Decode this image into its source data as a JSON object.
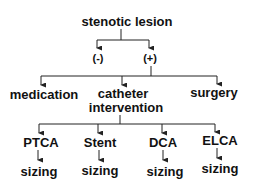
{
  "diagram": {
    "root": {
      "label": "stenotic lesion"
    },
    "level1": [
      {
        "label": "(-)"
      },
      {
        "label": "(+)"
      }
    ],
    "level2": [
      {
        "label": "medication"
      },
      {
        "label_line1": "catheter",
        "label_line2": "intervention"
      },
      {
        "label": "surgery"
      }
    ],
    "level3": [
      {
        "label": "PTCA",
        "child": "sizing"
      },
      {
        "label": "Stent",
        "child": "sizing"
      },
      {
        "label": "DCA",
        "child": "sizing"
      },
      {
        "label": "ELCA",
        "child": "sizing"
      }
    ],
    "colors": {
      "line": "#222222",
      "text": "#111111",
      "background": "#ffffff"
    }
  }
}
